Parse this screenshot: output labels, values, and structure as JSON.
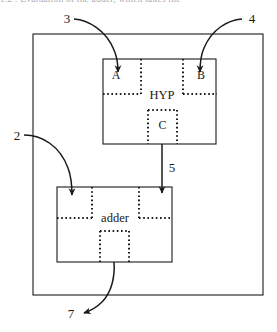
{
  "figure": {
    "caption_cut_text": "1.2    . Evaluation of the adder, which takes the",
    "outer_container": {
      "name": "outer-boundary"
    },
    "blocks": [
      {
        "id": "hyp",
        "label": "HYP",
        "subcells": [
          {
            "id": "a",
            "label": "A"
          },
          {
            "id": "b",
            "label": "B"
          },
          {
            "id": "c",
            "label": "C"
          }
        ]
      },
      {
        "id": "adder",
        "label": "adder",
        "subcells": [
          {
            "id": "adder-in-left",
            "label": ""
          },
          {
            "id": "adder-in-right",
            "label": ""
          },
          {
            "id": "adder-out",
            "label": ""
          }
        ]
      }
    ],
    "callouts": [
      {
        "id": "callout-3",
        "label": "3",
        "target": "A"
      },
      {
        "id": "callout-4",
        "label": "4",
        "target": "B"
      },
      {
        "id": "callout-2",
        "label": "2",
        "target": "adder"
      },
      {
        "id": "callout-5",
        "label": "5",
        "target": "hyp-to-adder"
      },
      {
        "id": "callout-7",
        "label": "7",
        "target": "adder-output"
      }
    ],
    "colors": {
      "stroke": "#1a1a1a",
      "dotted": "#1a1a1a",
      "background": "#ffffff"
    }
  }
}
